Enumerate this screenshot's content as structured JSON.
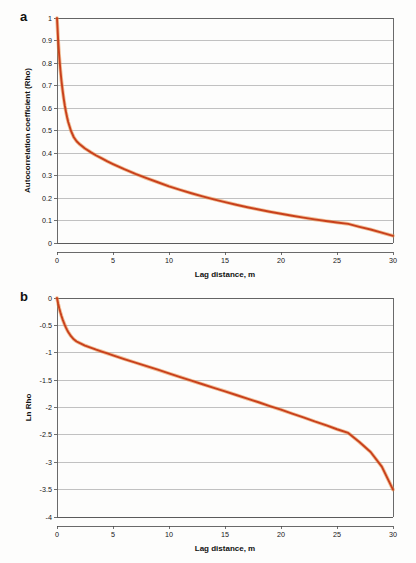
{
  "figure": {
    "background": "#fdfdfc",
    "line_color": "#c8401c",
    "line_halo_color": "#e8893f",
    "grid_color": "#9a9a9a",
    "axis_color": "#5a5a5a"
  },
  "panels": [
    {
      "id": "a",
      "label": "a"
    },
    {
      "id": "b",
      "label": "b"
    }
  ],
  "chart_data": [
    {
      "type": "line",
      "panel": "a",
      "title": "",
      "xlabel": "Lag distance, m",
      "ylabel": "Autocorrelation coefficient (Rho)",
      "xlim": [
        0,
        30
      ],
      "ylim": [
        0,
        1
      ],
      "grid": true,
      "legend": "none",
      "xticks": [
        0,
        5,
        10,
        15,
        20,
        25,
        30
      ],
      "xtick_labels": [
        "0",
        "5",
        "10",
        "15",
        "20",
        "25",
        "30"
      ],
      "yticks": [
        0,
        0.1,
        0.2,
        0.3,
        0.4,
        0.5,
        0.6,
        0.7,
        0.8,
        0.9,
        1
      ],
      "ytick_labels": [
        "0",
        "0.1",
        "0.2",
        "0.3",
        "0.4",
        "0.5",
        "0.6",
        "0.7",
        "0.8",
        "0.9",
        "1"
      ],
      "series": [
        {
          "name": "Autocorrelation",
          "x": [
            0,
            0.1,
            0.2,
            0.3,
            0.4,
            0.5,
            0.6,
            0.7,
            0.8,
            0.9,
            1,
            1.25,
            1.5,
            1.75,
            2,
            2.5,
            3,
            3.5,
            4,
            4.5,
            5,
            6,
            7,
            8,
            9,
            10,
            11,
            12,
            13,
            14,
            15,
            16,
            17,
            18,
            19,
            20,
            21,
            22,
            23,
            24,
            25,
            26,
            27,
            28,
            29,
            30
          ],
          "y": [
            1.0,
            0.905,
            0.83,
            0.77,
            0.72,
            0.678,
            0.642,
            0.61,
            0.583,
            0.559,
            0.538,
            0.498,
            0.47,
            0.452,
            0.44,
            0.42,
            0.404,
            0.389,
            0.376,
            0.363,
            0.351,
            0.328,
            0.307,
            0.288,
            0.27,
            0.252,
            0.236,
            0.221,
            0.207,
            0.194,
            0.182,
            0.17,
            0.159,
            0.149,
            0.139,
            0.13,
            0.121,
            0.113,
            0.105,
            0.098,
            0.091,
            0.085,
            0.072,
            0.06,
            0.046,
            0.032
          ]
        }
      ]
    },
    {
      "type": "line",
      "panel": "b",
      "title": "",
      "xlabel": "Lag distance, m",
      "ylabel": "Ln  Rho",
      "xlim": [
        0,
        30
      ],
      "ylim": [
        -4,
        0
      ],
      "grid": true,
      "legend": "none",
      "xticks": [
        0,
        5,
        10,
        15,
        20,
        25,
        30
      ],
      "xtick_labels": [
        "0",
        "5",
        "10",
        "15",
        "20",
        "25",
        "30"
      ],
      "yticks": [
        -4,
        -3.5,
        -3,
        -2.5,
        -2,
        -1.5,
        -1,
        -0.5,
        0
      ],
      "ytick_labels": [
        "-4",
        "-3.5",
        "-3",
        "-2.5",
        "-2",
        "-1.5",
        "-1",
        "-0.5",
        "0"
      ],
      "series": [
        {
          "name": "Ln Rho",
          "x": [
            0,
            0.1,
            0.2,
            0.3,
            0.4,
            0.5,
            0.6,
            0.7,
            0.8,
            0.9,
            1,
            1.25,
            1.5,
            1.75,
            2,
            2.5,
            3,
            3.5,
            4,
            4.5,
            5,
            6,
            7,
            8,
            9,
            10,
            11,
            12,
            13,
            14,
            15,
            16,
            17,
            18,
            19,
            20,
            21,
            22,
            23,
            24,
            25,
            26,
            27,
            28,
            29,
            30
          ],
          "y": [
            0.0,
            -0.1,
            -0.186,
            -0.261,
            -0.329,
            -0.389,
            -0.443,
            -0.494,
            -0.54,
            -0.582,
            -0.62,
            -0.697,
            -0.755,
            -0.794,
            -0.821,
            -0.868,
            -0.906,
            -0.944,
            -0.978,
            -1.013,
            -1.047,
            -1.115,
            -1.181,
            -1.245,
            -1.309,
            -1.378,
            -1.444,
            -1.51,
            -1.575,
            -1.64,
            -1.704,
            -1.772,
            -1.839,
            -1.904,
            -1.974,
            -2.04,
            -2.112,
            -2.18,
            -2.254,
            -2.323,
            -2.397,
            -2.465,
            -2.631,
            -2.813,
            -3.079,
            -3.5
          ]
        }
      ]
    }
  ]
}
